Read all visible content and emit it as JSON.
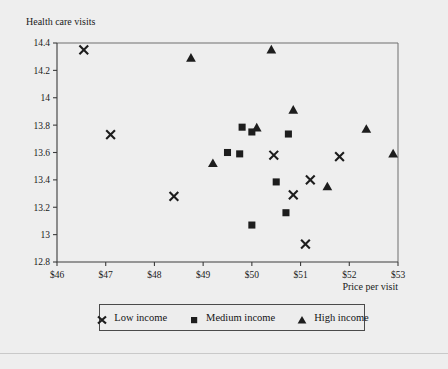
{
  "figure": {
    "plot_title": "Health care visits",
    "xlabel": "Price per visit",
    "background_color": "#eeeeee",
    "frame_color": "#6e6e6e",
    "axis_color": "#3c3c3c",
    "marker_color": "#1d1d1d"
  },
  "legend": {
    "entries": [
      {
        "label": "Low income",
        "marker": "x-marker-icon"
      },
      {
        "label": "Medium income",
        "marker": "square-marker-icon"
      },
      {
        "label": "High income",
        "marker": "triangle-marker-icon"
      }
    ]
  },
  "chart_data": {
    "type": "scatter",
    "title": "Health care visits",
    "xlabel": "Price per visit",
    "ylabel": "Health care visits",
    "xlim": [
      46,
      53
    ],
    "ylim": [
      12.8,
      14.4
    ],
    "grid": false,
    "legend_position": "bottom",
    "xticks": [
      46,
      47,
      48,
      49,
      50,
      51,
      52,
      53
    ],
    "xticklabels": [
      "$46",
      "$47",
      "$48",
      "$49",
      "$50",
      "$51",
      "$52",
      "$53"
    ],
    "yticks": [
      12.8,
      13,
      13.2,
      13.4,
      13.6,
      13.8,
      14,
      14.2,
      14.4
    ],
    "yticklabels": [
      "12.8",
      "13",
      "13.2",
      "13.4",
      "13.6",
      "13.8",
      "14",
      "14.2",
      "14.4"
    ],
    "series": [
      {
        "name": "Low income",
        "marker": "x",
        "color": "#1d1d1d",
        "points": [
          {
            "x": 46.55,
            "y": 14.35
          },
          {
            "x": 47.1,
            "y": 13.73
          },
          {
            "x": 48.4,
            "y": 13.28
          },
          {
            "x": 50.45,
            "y": 13.58
          },
          {
            "x": 50.85,
            "y": 13.29
          },
          {
            "x": 51.1,
            "y": 12.93
          },
          {
            "x": 51.2,
            "y": 13.4
          },
          {
            "x": 51.8,
            "y": 13.57
          }
        ]
      },
      {
        "name": "Medium income",
        "marker": "square",
        "color": "#1d1d1d",
        "points": [
          {
            "x": 49.5,
            "y": 13.6
          },
          {
            "x": 49.75,
            "y": 13.59
          },
          {
            "x": 49.8,
            "y": 13.785
          },
          {
            "x": 50.0,
            "y": 13.75
          },
          {
            "x": 50.0,
            "y": 13.07
          },
          {
            "x": 50.5,
            "y": 13.385
          },
          {
            "x": 50.7,
            "y": 13.16
          },
          {
            "x": 50.75,
            "y": 13.735
          }
        ]
      },
      {
        "name": "High income",
        "marker": "triangle",
        "color": "#1d1d1d",
        "points": [
          {
            "x": 48.75,
            "y": 14.29
          },
          {
            "x": 49.2,
            "y": 13.52
          },
          {
            "x": 50.1,
            "y": 13.78
          },
          {
            "x": 50.4,
            "y": 14.35
          },
          {
            "x": 50.85,
            "y": 13.91
          },
          {
            "x": 51.55,
            "y": 13.35
          },
          {
            "x": 52.35,
            "y": 13.77
          },
          {
            "x": 52.9,
            "y": 13.59
          }
        ]
      }
    ]
  }
}
